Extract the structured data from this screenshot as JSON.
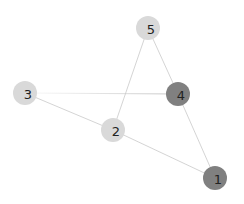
{
  "graph": {
    "type": "undirected-network",
    "node_radius": 12,
    "colors": {
      "light": "#d9d9d9",
      "dark": "#808080",
      "edge": "#cfcfcf",
      "label": "#222222",
      "background": "#ffffff"
    },
    "nodes": [
      {
        "id": "1",
        "label": "1",
        "x": 215,
        "y": 178,
        "color": "#808080"
      },
      {
        "id": "2",
        "label": "2",
        "x": 113,
        "y": 130,
        "color": "#d9d9d9"
      },
      {
        "id": "3",
        "label": "3",
        "x": 25,
        "y": 93,
        "color": "#d9d9d9"
      },
      {
        "id": "4",
        "label": "4",
        "x": 178,
        "y": 94,
        "color": "#808080"
      },
      {
        "id": "5",
        "label": "5",
        "x": 148,
        "y": 28,
        "color": "#d9d9d9"
      }
    ],
    "edges": [
      {
        "source": "5",
        "target": "2"
      },
      {
        "source": "5",
        "target": "4"
      },
      {
        "source": "3",
        "target": "4"
      },
      {
        "source": "3",
        "target": "2"
      },
      {
        "source": "2",
        "target": "1"
      },
      {
        "source": "4",
        "target": "1"
      }
    ]
  }
}
